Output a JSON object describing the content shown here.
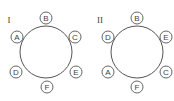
{
  "diagrams": [
    {
      "label": "I",
      "center": [
        46,
        52
      ],
      "radius": 26,
      "seats": [
        {
          "name": "B",
          "x": 46,
          "y": 18
        },
        {
          "name": "A",
          "x": 17,
          "y": 37
        },
        {
          "name": "C",
          "x": 75,
          "y": 37
        },
        {
          "name": "D",
          "x": 16,
          "y": 72
        },
        {
          "name": "E",
          "x": 76,
          "y": 72
        },
        {
          "name": "F",
          "x": 47,
          "y": 87
        }
      ]
    },
    {
      "label": "II",
      "center": [
        137,
        52
      ],
      "radius": 26,
      "seats": [
        {
          "name": "B",
          "x": 137,
          "y": 18
        },
        {
          "name": "D",
          "x": 108,
          "y": 37
        },
        {
          "name": "E",
          "x": 166,
          "y": 37
        },
        {
          "name": "A",
          "x": 108,
          "y": 72
        },
        {
          "name": "C",
          "x": 166,
          "y": 72
        },
        {
          "name": "F",
          "x": 137,
          "y": 87
        }
      ]
    }
  ],
  "colors": {
    "stroke": "#555555",
    "text": "#444444"
  }
}
